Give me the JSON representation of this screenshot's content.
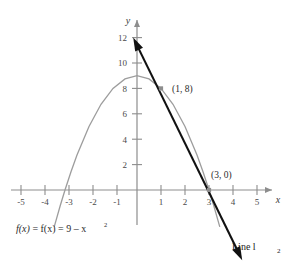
{
  "chart_data": {
    "type": "line",
    "title": "",
    "xlabel": "x",
    "ylabel": "y",
    "xlim": [
      -5.8,
      5.9
    ],
    "ylim": [
      -3.2,
      13.2
    ],
    "grid": false,
    "legend": "none",
    "x_ticks": [
      -5,
      -4,
      -3,
      -2,
      -1,
      1,
      2,
      3,
      4,
      5
    ],
    "x_tick_labels": [
      "-5",
      "-4",
      "-3",
      "-2",
      "-1",
      "1",
      "2",
      "3",
      "4",
      "5"
    ],
    "y_ticks": [
      2,
      4,
      6,
      8,
      10,
      12
    ],
    "y_tick_labels": [
      "2",
      "4",
      "6",
      "8",
      "10",
      "12"
    ],
    "series": [
      {
        "name": "f(x) = 9 - x^2",
        "type": "parabola",
        "color": "#9a9a9a",
        "label": "f(x) = 9 – x",
        "label_exponent": "2",
        "equation_lhs": "f(x)",
        "equation_rhs": "9 – x²",
        "vertex": [
          0,
          9
        ],
        "roots": [
          -3,
          3
        ],
        "points": [
          [
            -3.45,
            -2.9
          ],
          [
            -3.2,
            -1.24
          ],
          [
            -3.0,
            0
          ],
          [
            -2.75,
            1.44
          ],
          [
            -2.5,
            2.75
          ],
          [
            -2.0,
            5.0
          ],
          [
            -1.5,
            6.75
          ],
          [
            -1.0,
            8.0
          ],
          [
            -0.5,
            8.75
          ],
          [
            0,
            9.0
          ],
          [
            0.5,
            8.75
          ],
          [
            1.0,
            8.0
          ],
          [
            1.5,
            6.75
          ],
          [
            2.0,
            5.0
          ],
          [
            2.5,
            2.75
          ],
          [
            2.75,
            1.44
          ],
          [
            3.0,
            0
          ],
          [
            3.2,
            -1.24
          ],
          [
            3.45,
            -2.9
          ]
        ]
      },
      {
        "name": "Line l2",
        "type": "secant-line",
        "color": "#111111",
        "label": "Line l",
        "label_subscript": "2",
        "through_points": [
          [
            1,
            8
          ],
          [
            3,
            0
          ]
        ],
        "slope": -4,
        "intercept": 12,
        "arrow_start": [
          -0.08,
          11.7
        ],
        "arrow_end": [
          4.3,
          -5.2
        ],
        "double_arrow": true
      }
    ],
    "annotations": [
      {
        "text": "(1, 8)",
        "point": [
          1,
          8
        ],
        "label_at": [
          1.45,
          8.35
        ],
        "marker": true
      },
      {
        "text": "(3, 0)",
        "point": [
          3,
          0
        ],
        "label_at": [
          3.15,
          1.15
        ],
        "marker": true
      }
    ]
  },
  "axes": {
    "x_axis_name": "x",
    "y_axis_name": "y"
  }
}
